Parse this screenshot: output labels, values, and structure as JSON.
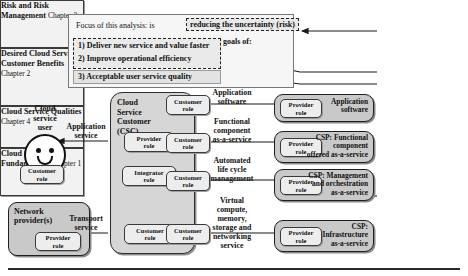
{
  "diagram": {
    "focus": {
      "line1_prefix": "Focus of this analysis: is",
      "risk_chip": "reducing the uncertainty (risk)",
      "line2": "of a cloud service customer achieving their goals of:",
      "goals": [
        "1) Deliver new service and value faster",
        "2) Improve operational efficiency",
        "3) Acceptable user service quality"
      ]
    },
    "actors": {
      "cloud_service_user": "Cloud\nservice\nuser",
      "cloud_service_user_lines": [
        "Cloud",
        "service",
        "user"
      ],
      "network_provider": "Network\nprovider(s)",
      "network_provider_lines": [
        "Network",
        "provider(s)"
      ],
      "csc_title_lines": [
        "Cloud",
        "Service",
        "Customer",
        "(CSC)"
      ]
    },
    "roles": {
      "customer": "Customer\nrole",
      "customer_lines": [
        "Customer",
        "role"
      ],
      "provider": "Provider\nrole",
      "provider_lines": [
        "Provider",
        "role"
      ],
      "integrator": "Integrator\nrole",
      "integrator_lines": [
        "Integrator",
        "role"
      ]
    },
    "service_labels": {
      "application_service": [
        "Application",
        "service"
      ],
      "transport_service": [
        "Transport",
        "service"
      ]
    },
    "middle_labels": [
      {
        "lines": [
          "Application",
          "software"
        ]
      },
      {
        "lines": [
          "Functional",
          "component",
          "as-a-service"
        ]
      },
      {
        "lines": [
          "Automated",
          "life cycle",
          "management"
        ]
      },
      {
        "lines": [
          "Virtual",
          "compute,",
          "memory,",
          "storage and",
          "networking",
          "service"
        ]
      }
    ],
    "provider_stack": [
      {
        "lines": [
          "Application",
          "software"
        ]
      },
      {
        "lines": [
          "CSP: Functional",
          "component",
          "offered as-a-service"
        ]
      },
      {
        "lines": [
          "CSP: Management",
          "and orchestration",
          "as-a-service"
        ]
      },
      {
        "lines": [
          "CSP:",
          "Infrastructure",
          "as-a-service"
        ]
      }
    ],
    "chapters": [
      {
        "title_lines": [
          "Risk and",
          "Risk",
          "Management"
        ],
        "chapter": "Chapter 3"
      },
      {
        "title_lines": [
          "Desired Cloud",
          "Service",
          "Customer",
          "Benefits"
        ],
        "chapter": "Chapter 2"
      },
      {
        "title_lines": [
          "Cloud Service",
          "Qualities"
        ],
        "chapter": "Chapter 4"
      },
      {
        "title_lines": [
          "Cloud",
          "Computing",
          "Fundamentals"
        ],
        "chapter": "Chapter 1"
      }
    ],
    "colors": {
      "panel_bg": "#f6f6f6",
      "csc_bg": "#d6d6d6",
      "csp_bg": "#c9c9c9",
      "role_bg": "#ededed",
      "chapter_bg": "#f2f2f2",
      "line": "#2a2a2a"
    }
  }
}
